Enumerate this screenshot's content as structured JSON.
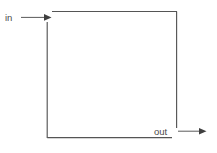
{
  "diagram": {
    "type": "flow-box",
    "background_color": "#ffffff",
    "line_color": "#555555",
    "label_color": "#4a4a4a",
    "labels": {
      "input": "in",
      "output": "out"
    },
    "geometry": {
      "box_left_x": 47,
      "box_right_x": 177,
      "box_top_y": 11,
      "box_bottom_y": 138,
      "top_line_start_x": 52,
      "left_line_start_y": 22,
      "right_line_end_y": 128,
      "bottom_line_end_x": 172
    },
    "arrows": [
      {
        "name": "in-arrow",
        "x1": 21,
        "x2": 51,
        "y": 17,
        "direction": "right"
      },
      {
        "name": "out-arrow",
        "x1": 178,
        "x2": 206,
        "y": 131,
        "direction": "right"
      }
    ]
  }
}
